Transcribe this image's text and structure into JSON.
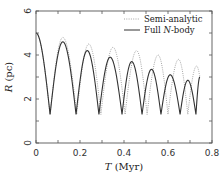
{
  "chart_data": {
    "type": "line",
    "title": "",
    "xlabel": "T (Myr)",
    "xlabel_italic": "T",
    "xlabel_unit": " (Myr)",
    "ylabel": "R (pc)",
    "ylabel_italic": "R",
    "ylabel_unit": " (pc)",
    "xlim": [
      0,
      0.8
    ],
    "ylim": [
      0,
      6
    ],
    "xticks": [
      0,
      0.2,
      0.4,
      0.6,
      0.8
    ],
    "xtick_labels": [
      "0",
      "0.2",
      "0.4",
      "0.6",
      "0.8"
    ],
    "x_minor_ticks": [
      0.1,
      0.3,
      0.5,
      0.7
    ],
    "yticks": [
      0,
      2,
      4,
      6
    ],
    "ytick_labels": [
      "0",
      "2",
      "4",
      "6"
    ],
    "y_minor_ticks": [
      1,
      3,
      5
    ],
    "grid": false,
    "legend_position": "upper right",
    "series": [
      {
        "name": "Semi-analytic",
        "style": "dotted",
        "color": "#9a9a9a",
        "extrema": [
          [
            0.0,
            5.0
          ],
          [
            0.064,
            1.3
          ],
          [
            0.122,
            4.8
          ],
          [
            0.185,
            1.3
          ],
          [
            0.24,
            4.5
          ],
          [
            0.295,
            1.3
          ],
          [
            0.35,
            4.35
          ],
          [
            0.405,
            1.3
          ],
          [
            0.457,
            4.2
          ],
          [
            0.505,
            1.3
          ],
          [
            0.555,
            4.0
          ],
          [
            0.6,
            1.3
          ],
          [
            0.648,
            3.8
          ],
          [
            0.69,
            1.3
          ],
          [
            0.73,
            3.5
          ],
          [
            0.745,
            3.0
          ]
        ]
      },
      {
        "name": "Full N-body",
        "legend_italic": "N",
        "style": "solid",
        "color": "#333333",
        "extrema": [
          [
            0.0,
            5.0
          ],
          [
            0.064,
            1.3
          ],
          [
            0.122,
            4.6
          ],
          [
            0.182,
            1.3
          ],
          [
            0.233,
            4.2
          ],
          [
            0.286,
            1.3
          ],
          [
            0.337,
            3.9
          ],
          [
            0.391,
            1.3
          ],
          [
            0.435,
            3.7
          ],
          [
            0.482,
            1.3
          ],
          [
            0.525,
            3.35
          ],
          [
            0.568,
            1.3
          ],
          [
            0.61,
            3.1
          ],
          [
            0.655,
            1.3
          ],
          [
            0.69,
            2.85
          ],
          [
            0.727,
            1.3
          ],
          [
            0.745,
            3.0
          ]
        ]
      }
    ]
  },
  "legend": {
    "items": [
      {
        "prefix": "Semi-analytic",
        "italic": "",
        "suffix": ""
      },
      {
        "prefix": "Full ",
        "italic": "N",
        "suffix": "-body"
      }
    ]
  }
}
